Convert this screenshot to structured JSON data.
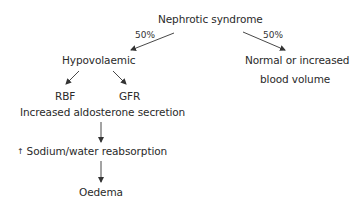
{
  "diagram": {
    "root": {
      "label": "Nephrotic syndrome"
    },
    "branches": [
      {
        "percent": "50%",
        "label": "Hypovolaemic"
      },
      {
        "percent": "50%",
        "label_line1": "Normal or increased",
        "label_line2": "blood volume"
      }
    ],
    "hypovolaemic_children": [
      {
        "label": "RBF"
      },
      {
        "label": "GFR"
      }
    ],
    "chain": [
      {
        "label": "Increased aldosterone secretion"
      },
      {
        "prefix_icon": "up-arrow-icon",
        "prefix_glyph": "↑",
        "label": "Sodium/water reabsorption"
      },
      {
        "label": "Oedema"
      }
    ],
    "colors": {
      "text": "#2a2a2a",
      "arrow": "#333333",
      "background": "#ffffff"
    }
  }
}
